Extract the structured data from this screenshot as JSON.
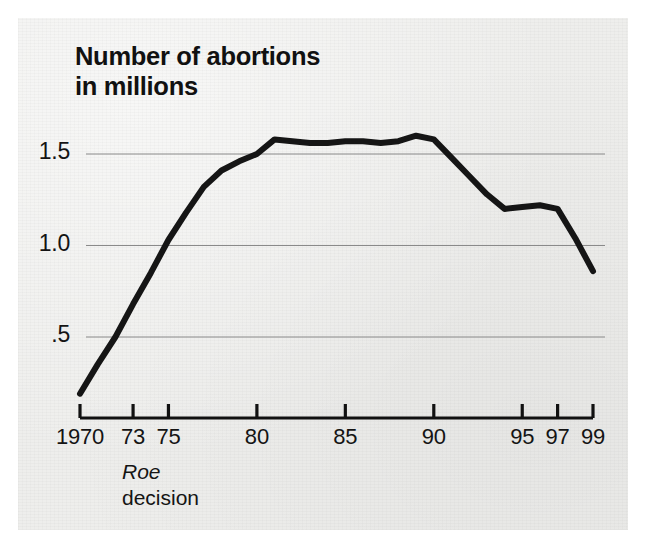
{
  "figure": {
    "title_line1": "Number of abortions",
    "title_line2": "in millions",
    "title": "Number of abortions\nin millions",
    "annotation": {
      "italic_term": "Roe",
      "second_line": "decision",
      "at_year": 1973
    },
    "colors": {
      "paper": "#eeeeec",
      "ink": "#111111",
      "line": "#151515",
      "gridline": "#8a8a8a",
      "axis": "#111111"
    }
  },
  "chart_data": {
    "type": "line",
    "title": "Number of abortions in millions",
    "xlabel": "",
    "ylabel": "",
    "ylim": [
      0,
      1.75
    ],
    "xlim": [
      1970,
      1999
    ],
    "grid": true,
    "legend": false,
    "y_ticks": [
      0.5,
      1.0,
      1.5
    ],
    "y_tick_labels": [
      ".5",
      "1.0",
      "1.5"
    ],
    "x_ticks": [
      1970,
      1973,
      1975,
      1980,
      1985,
      1990,
      1995,
      1997,
      1999
    ],
    "x_tick_labels": [
      "1970",
      "73",
      "75",
      "80",
      "85",
      "90",
      "95",
      "97",
      "99"
    ],
    "x": [
      1970,
      1971,
      1972,
      1973,
      1974,
      1975,
      1976,
      1977,
      1978,
      1979,
      1980,
      1981,
      1982,
      1983,
      1984,
      1985,
      1986,
      1987,
      1988,
      1989,
      1990,
      1991,
      1992,
      1993,
      1994,
      1995,
      1996,
      1997,
      1998,
      1999
    ],
    "values": [
      0.19,
      0.35,
      0.5,
      0.68,
      0.85,
      1.03,
      1.18,
      1.32,
      1.41,
      1.46,
      1.5,
      1.58,
      1.57,
      1.56,
      1.56,
      1.57,
      1.57,
      1.56,
      1.57,
      1.6,
      1.58,
      1.48,
      1.38,
      1.28,
      1.2,
      1.21,
      1.22,
      1.2,
      1.04,
      0.86
    ],
    "series": [
      {
        "name": "Number of abortions (millions)",
        "values": [
          0.19,
          0.35,
          0.5,
          0.68,
          0.85,
          1.03,
          1.18,
          1.32,
          1.41,
          1.46,
          1.5,
          1.58,
          1.57,
          1.56,
          1.56,
          1.57,
          1.57,
          1.56,
          1.57,
          1.6,
          1.58,
          1.48,
          1.38,
          1.28,
          1.2,
          1.21,
          1.22,
          1.2,
          1.04,
          0.86
        ]
      }
    ],
    "annotations": [
      {
        "text": "Roe decision",
        "x": 1973,
        "style": "axis-note"
      }
    ]
  },
  "y_axis": [
    {
      "label": "1.5",
      "value": 1.5
    },
    {
      "label": "1.0",
      "value": 1.0
    },
    {
      "label": ".5",
      "value": 0.5
    }
  ],
  "x_axis": [
    {
      "label": "1970",
      "value": 1970
    },
    {
      "label": "73",
      "value": 1973
    },
    {
      "label": "75",
      "value": 1975
    },
    {
      "label": "80",
      "value": 1980
    },
    {
      "label": "85",
      "value": 1985
    },
    {
      "label": "90",
      "value": 1990
    },
    {
      "label": "95",
      "value": 1995
    },
    {
      "label": "97",
      "value": 1997
    },
    {
      "label": "99",
      "value": 1999
    }
  ]
}
